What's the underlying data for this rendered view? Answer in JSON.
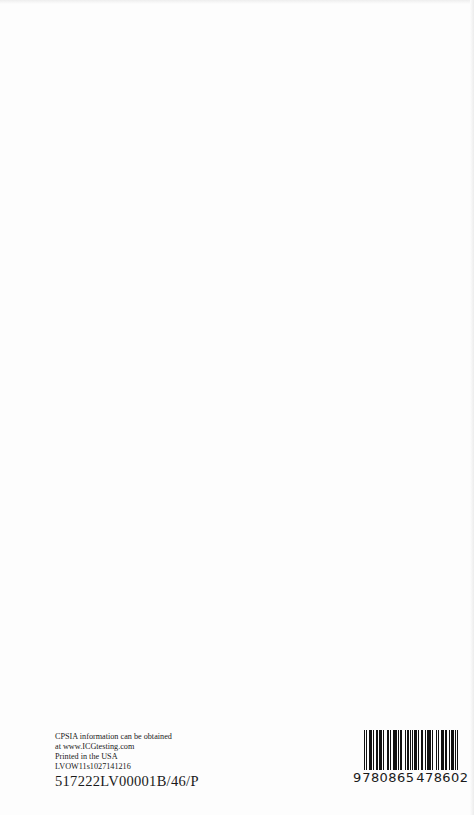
{
  "page": {
    "imprint": {
      "line1": "CPSIA information can be obtained",
      "line2": "at www.ICGtesting.com",
      "line3": "Printed in the USA",
      "line4": "LVOW11s1027141216",
      "line5": "517222LV00001B/46/P"
    },
    "barcode": {
      "type": "EAN-13",
      "value": "9780865478602",
      "first_digit": "9",
      "group1": "780865",
      "group2": "478602"
    }
  }
}
